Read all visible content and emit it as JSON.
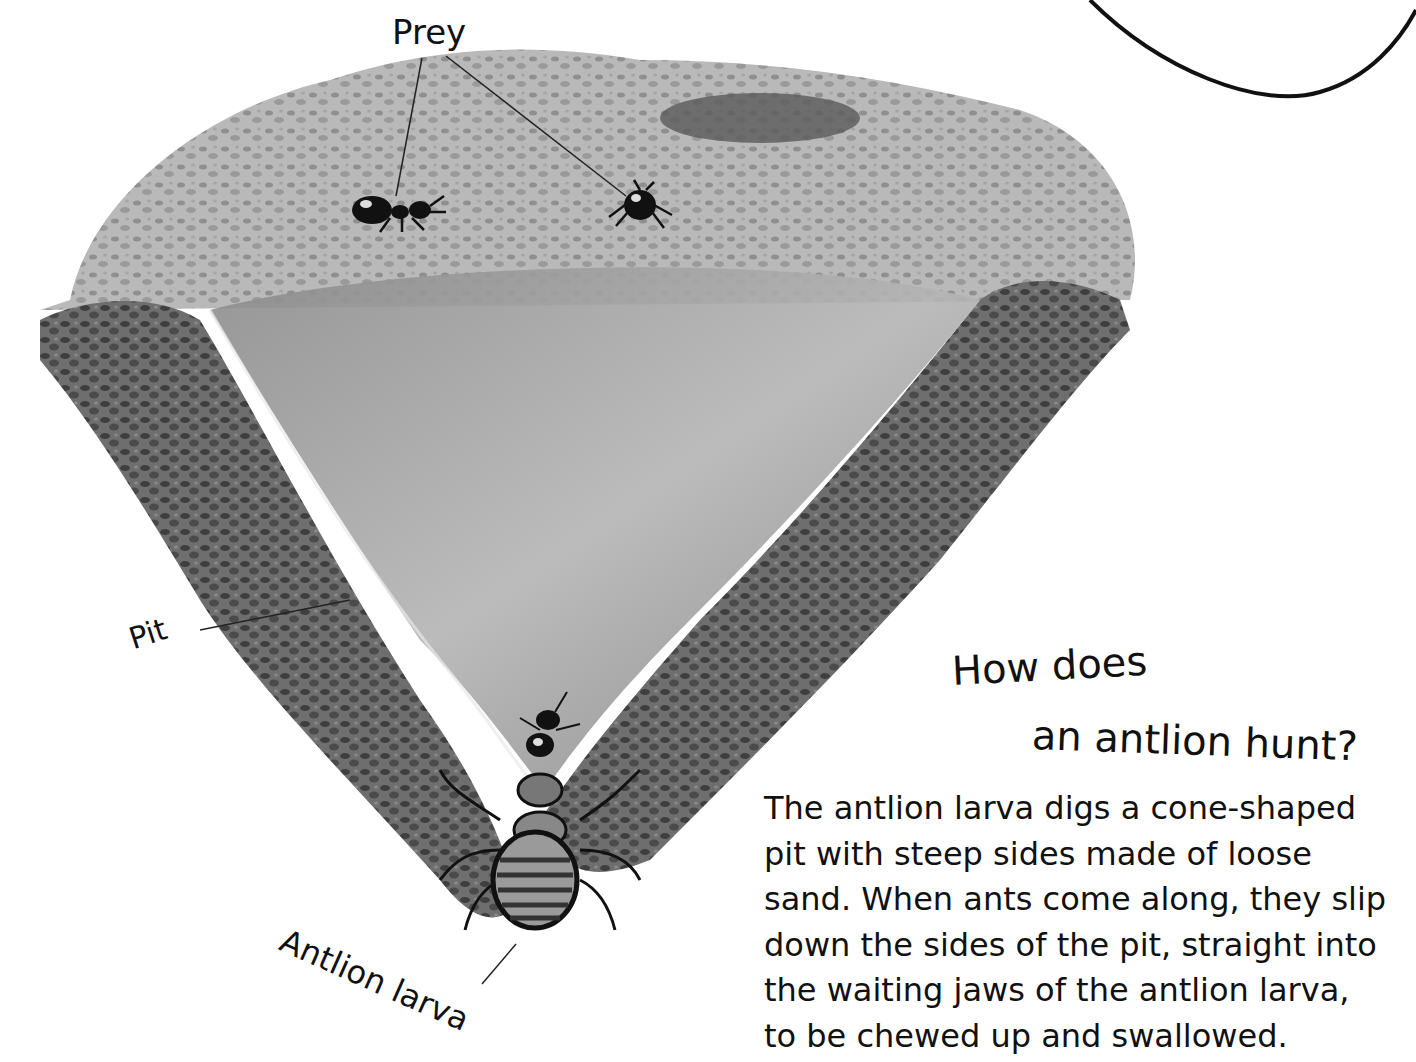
{
  "labels": {
    "prey": "Prey",
    "pit": "Pit",
    "larva": "Antlion larva"
  },
  "heading": {
    "line1": "How does",
    "line2": "an antlion hunt?"
  },
  "body": {
    "lines": [
      "The antlion larva digs a cone-shaped",
      "pit with steep sides made of loose",
      "sand. When ants come along, they slip",
      "down the sides of the pit, straight into",
      "the waiting jaws of the antlion larva,",
      "to be chewed up and swallowed."
    ]
  },
  "colors": {
    "background": "#ffffff",
    "text": "#111111",
    "sand_light": "#c8c8c8",
    "sand_dark": "#5a5a5a"
  }
}
